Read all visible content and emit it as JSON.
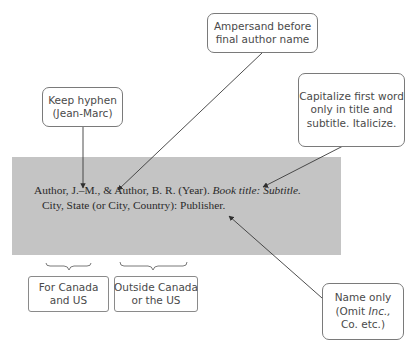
{
  "reference": {
    "line1_part1": "Author, J.–M., & Author, B. R. (Year). ",
    "line1_italic": "Book title: Subtitle.",
    "line2": "City, State (or City, Country): Publisher."
  },
  "callouts": {
    "keep_hyphen": [
      "Keep hyphen",
      "(Jean-Marc)"
    ],
    "ampersand": [
      "Ampersand before",
      "final author name"
    ],
    "capitalize": [
      "Capitalize first word",
      "only in title and",
      "subtitle. Italicize."
    ],
    "name_only": {
      "line1": "Name only",
      "line2_pre": "(Omit ",
      "line2_italic": "Inc.,",
      "line3": "Co. etc.)"
    }
  },
  "location_labels": {
    "canada_us": [
      "For Canada",
      "and US"
    ],
    "outside": [
      "Outside Canada",
      "or the US"
    ]
  },
  "colors": {
    "panel": "#c4c4c4",
    "border": "#7a7a7a",
    "text": "#4a4a4a",
    "arrow": "#3a3a3a"
  }
}
